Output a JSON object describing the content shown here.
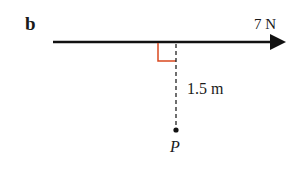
{
  "figure": {
    "part_label": "b",
    "force_label": "7 N",
    "distance_label": "1.5 m",
    "point_label": "P"
  },
  "colors": {
    "line": "#111111",
    "right_angle_marker": "#d9481f",
    "background": "#ffffff"
  }
}
